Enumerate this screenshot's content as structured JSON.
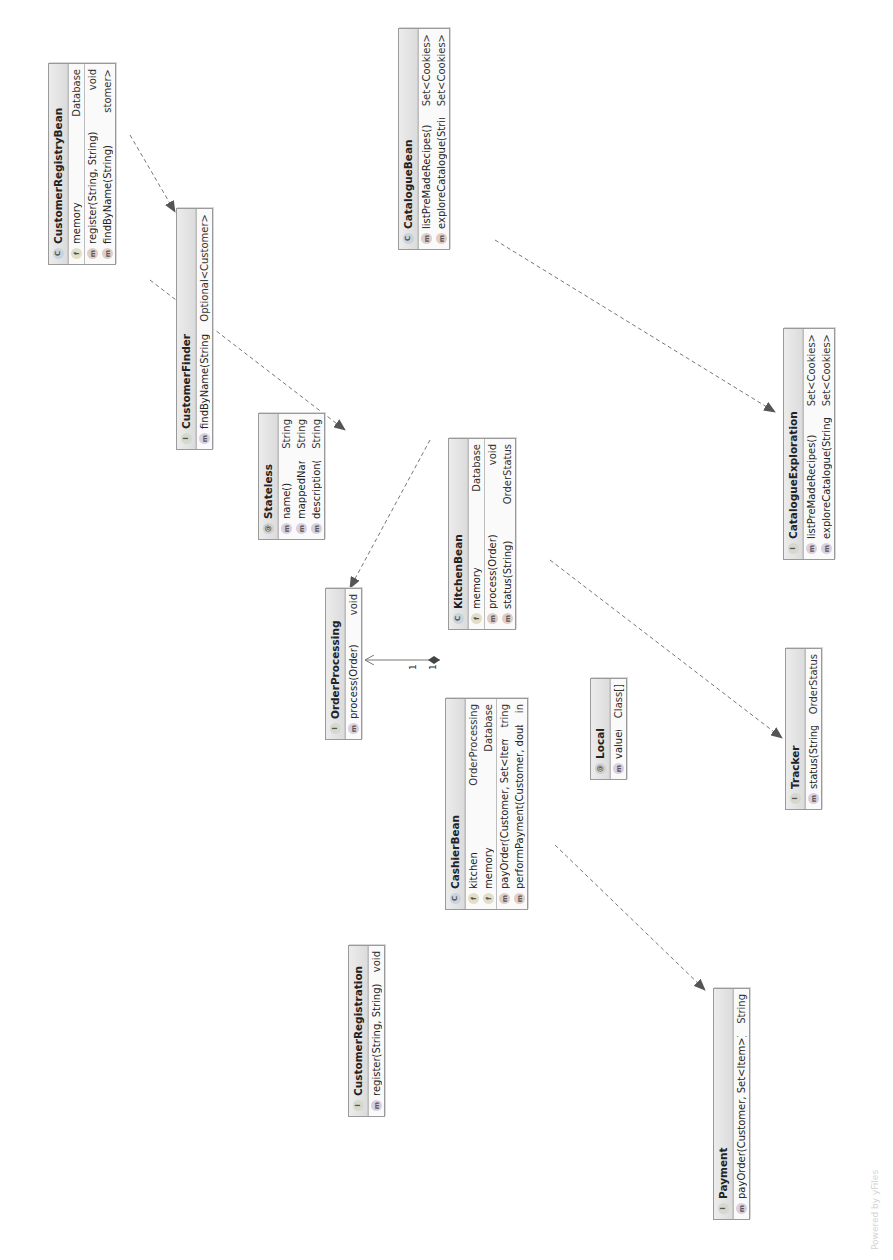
{
  "diagram": {
    "type": "UML class diagram",
    "orientation": "rotated 90deg counter-clockwise",
    "watermark": "Powered by yFiles",
    "colors": {
      "header_bg": "#e4e4e4",
      "border": "#9a9a9a",
      "edge": "#666666"
    }
  },
  "nodes": {
    "customer_registry_bean": {
      "kind": "class",
      "badge": "c",
      "name": "CustomerRegistryBean",
      "fields": [
        {
          "name": "memory",
          "type": "Database"
        }
      ],
      "methods": [
        {
          "name": "register(String, String)",
          "type": "void"
        },
        {
          "name": "findByName(String)",
          "type": "stomer>"
        }
      ]
    },
    "customer_finder": {
      "kind": "interface",
      "badge": "i",
      "name": "CustomerFinder",
      "methods": [
        {
          "name": "findByName(String)",
          "type": "Optional<Customer>"
        }
      ]
    },
    "customer_registration": {
      "kind": "interface",
      "badge": "i",
      "name": "CustomerRegistration",
      "methods": [
        {
          "name": "register(String, String)",
          "type": "void"
        }
      ]
    },
    "stateless": {
      "kind": "annotation",
      "badge": "@",
      "name": "Stateless",
      "methods": [
        {
          "name": "name()",
          "type": "String"
        },
        {
          "name": "mappedName()",
          "type": "String"
        },
        {
          "name": "description()",
          "type": "String"
        }
      ]
    },
    "order_processing": {
      "kind": "interface",
      "badge": "i",
      "name": "OrderProcessing",
      "methods": [
        {
          "name": "process(Order)",
          "type": "void"
        }
      ]
    },
    "kitchen_bean": {
      "kind": "class",
      "badge": "c",
      "name": "KitchenBean",
      "fields": [
        {
          "name": "memory",
          "type": "Database"
        }
      ],
      "methods": [
        {
          "name": "process(Order)",
          "type": "void"
        },
        {
          "name": "status(String)",
          "type": "OrderStatus"
        }
      ]
    },
    "cashier_bean": {
      "kind": "class",
      "badge": "c",
      "name": "CashierBean",
      "fields": [
        {
          "name": "kitchen",
          "type": "OrderProcessing"
        },
        {
          "name": "memory",
          "type": "Database"
        }
      ],
      "methods": [
        {
          "name": "payOrder(Customer, Set<Item>)",
          "type": "tring"
        },
        {
          "name": "performPayment(Customer, double)",
          "type": "in"
        }
      ]
    },
    "local": {
      "kind": "annotation",
      "badge": "@",
      "name": "Local",
      "methods": [
        {
          "name": "value()",
          "type": "Class[]"
        }
      ]
    },
    "payment": {
      "kind": "interface",
      "badge": "i",
      "name": "Payment",
      "methods": [
        {
          "name": "payOrder(Customer, Set<Item>)",
          "type": "String"
        }
      ]
    },
    "tracker": {
      "kind": "interface",
      "badge": "i",
      "name": "Tracker",
      "methods": [
        {
          "name": "status(String)",
          "type": "OrderStatus"
        }
      ]
    },
    "catalogue_bean": {
      "kind": "class",
      "badge": "c",
      "name": "CatalogueBean",
      "methods": [
        {
          "name": "listPreMadeRecipes()",
          "type": "Set<Cookies>"
        },
        {
          "name": "exploreCatalogue(String)",
          "type": "Set<Cookies>"
        }
      ]
    },
    "catalogue_exploration": {
      "kind": "interface",
      "badge": "i",
      "name": "CatalogueExploration",
      "methods": [
        {
          "name": "listPreMadeRecipes()",
          "type": "Set<Cookies>"
        },
        {
          "name": "exploreCatalogue(String)",
          "type": "Set<Cookies>"
        }
      ]
    }
  },
  "edges": [
    {
      "from": "CustomerRegistryBean",
      "to": "CustomerFinder",
      "kind": "realization"
    },
    {
      "from": "CustomerRegistryBean",
      "to": "CustomerRegistration",
      "kind": "realization"
    },
    {
      "from": "KitchenBean",
      "to": "OrderProcessing",
      "kind": "realization"
    },
    {
      "from": "KitchenBean",
      "to": "Tracker",
      "kind": "realization"
    },
    {
      "from": "CashierBean",
      "to": "OrderProcessing",
      "kind": "composition",
      "source_mult": "1",
      "target_mult": "1"
    },
    {
      "from": "CashierBean",
      "to": "Payment",
      "kind": "realization"
    },
    {
      "from": "CatalogueBean",
      "to": "CatalogueExploration",
      "kind": "realization"
    }
  ]
}
